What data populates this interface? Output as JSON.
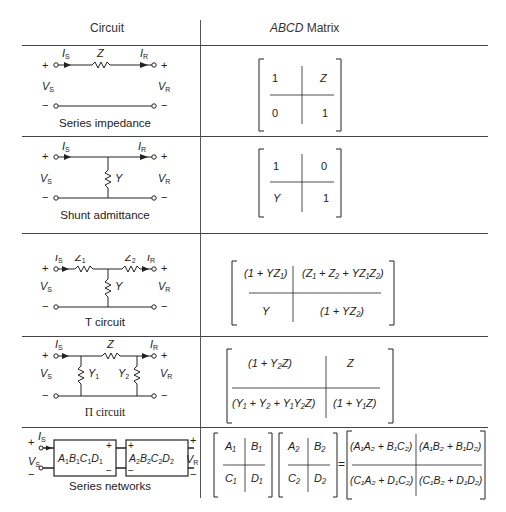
{
  "table": {
    "headers": {
      "circuit": "Circuit",
      "matrix_italic": "ABCD",
      "matrix_rest": " Matrix"
    },
    "rows": [
      {
        "caption": "Series impedance",
        "labels": {
          "is": "I",
          "is_sub": "S",
          "ir": "I",
          "ir_sub": "R",
          "vs": "V",
          "vs_sub": "S",
          "vr": "V",
          "vr_sub": "R",
          "element": "Z"
        },
        "matrix": {
          "a": "1",
          "b": "Z",
          "c": "0",
          "d": "1"
        }
      },
      {
        "caption": "Shunt admittance",
        "labels": {
          "element": "Y"
        },
        "matrix": {
          "a": "1",
          "b": "0",
          "c": "Y",
          "d": "1"
        }
      },
      {
        "caption": "T circuit",
        "labels": {
          "z1": "Z₁",
          "z2": "Z₂",
          "element": "Y"
        },
        "matrix": {
          "a": "(1 + YZ₁)",
          "b": "(Z₁ + Z₂ + YZ₁Z₂)",
          "c": "Y",
          "d": "(1 + YZ₂)"
        }
      },
      {
        "caption": "Π circuit",
        "labels": {
          "element": "Z",
          "y1": "Y₁",
          "y2": "Y₂"
        },
        "matrix": {
          "a": "(1 + Y₂Z)",
          "b": "Z",
          "c": "(Y₁ + Y₂ + Y₁Y₂Z)",
          "d": "(1 + Y₁Z)"
        }
      },
      {
        "caption": "Series networks",
        "labels": {
          "box1": "A₁B₁C₁D₁",
          "box2": "A₂B₂C₂D₂"
        },
        "matrix1": {
          "a": "A₁",
          "b": "B₁",
          "c": "C₁",
          "d": "D₁"
        },
        "matrix2": {
          "a": "A₂",
          "b": "B₂",
          "c": "C₂",
          "d": "D₂"
        },
        "equals": "=",
        "result": {
          "a": "(A₁A₂ + B₁C₂)",
          "b": "(A₁B₂ + B₁D₂)",
          "c": "(C₁A₂ + D₁C₂)",
          "d": "(C₁B₂ + D₁D₂)"
        }
      }
    ]
  }
}
